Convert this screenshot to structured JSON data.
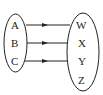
{
  "diagram": {
    "type": "function-mapping",
    "domain_set": {
      "name": "domain",
      "elements": [
        "A",
        "B",
        "C"
      ]
    },
    "codomain_set": {
      "name": "codomain",
      "elements": [
        "W",
        "X",
        "Y",
        "Z"
      ]
    },
    "mappings": [
      {
        "from": "A",
        "to": "W"
      },
      {
        "from": "B",
        "to": "X"
      },
      {
        "from": "C",
        "to": "Y"
      }
    ],
    "colors": {
      "stroke": "#222222",
      "background": "#ffffff"
    }
  }
}
